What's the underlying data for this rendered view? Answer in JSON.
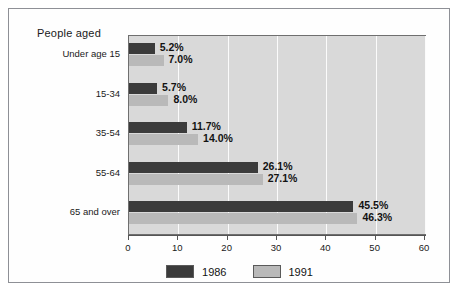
{
  "chart_data": {
    "type": "bar",
    "orientation": "horizontal",
    "title": "People aged",
    "xlabel": "",
    "ylabel": "",
    "xlim": [
      0,
      60
    ],
    "xticks": [
      0,
      10,
      20,
      30,
      40,
      50,
      60
    ],
    "grid": true,
    "legend_position": "bottom",
    "categories": [
      "Under age 15",
      "15-34",
      "35-54",
      "55-64",
      "65 and over"
    ],
    "series": [
      {
        "name": "1986",
        "color": "#3b3b3b",
        "values": [
          5.2,
          5.7,
          11.7,
          26.1,
          45.5
        ],
        "labels": [
          "5.2%",
          "5.7%",
          "11.7%",
          "26.1%",
          "45.5%"
        ]
      },
      {
        "name": "1991",
        "color": "#b9b9b9",
        "values": [
          7.0,
          8.0,
          14.0,
          27.1,
          46.3
        ],
        "labels": [
          "7.0%",
          "8.0%",
          "14.0%",
          "27.1%",
          "46.3%"
        ]
      }
    ]
  },
  "legend": {
    "items": [
      {
        "label": "1986",
        "color": "#3b3b3b"
      },
      {
        "label": "1991",
        "color": "#b9b9b9"
      }
    ]
  },
  "axis": {
    "tick_labels": [
      "0",
      "10",
      "20",
      "30",
      "40",
      "50",
      "60"
    ]
  },
  "colors": {
    "series_1986": "#3b3b3b",
    "series_1991": "#b9b9b9",
    "plot_background": "#d9d9d9",
    "gridline": "#fbfbfb",
    "frame_border": "#8e9096"
  }
}
